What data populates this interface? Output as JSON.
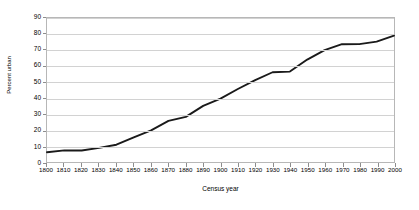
{
  "chart_data": {
    "type": "line",
    "title": "",
    "xlabel": "Census year",
    "ylabel": "Percent urban",
    "xlim": [
      1800,
      2000
    ],
    "ylim": [
      0,
      90
    ],
    "ytick_step": 10,
    "xtick_step": 10,
    "grid": true,
    "grid_axis": "y",
    "legend": false,
    "line_color": "#1a1a1a",
    "grid_color": "#d2d2d2",
    "border_color": "#b7b7b7",
    "yticks": [
      0,
      10,
      20,
      30,
      40,
      50,
      60,
      70,
      80,
      90
    ],
    "categories": [
      1800,
      1810,
      1820,
      1830,
      1840,
      1850,
      1860,
      1870,
      1880,
      1890,
      1900,
      1910,
      1920,
      1930,
      1940,
      1950,
      1960,
      1970,
      1980,
      1990,
      2000
    ],
    "x": [
      1800,
      1810,
      1820,
      1830,
      1840,
      1850,
      1860,
      1870,
      1880,
      1890,
      1900,
      1910,
      1920,
      1930,
      1940,
      1950,
      1960,
      1970,
      1980,
      1990,
      2000
    ],
    "values": [
      6.1,
      7.3,
      7.2,
      8.8,
      10.8,
      15.4,
      19.8,
      25.7,
      28.2,
      35.1,
      39.6,
      45.6,
      51.2,
      56.1,
      56.5,
      64.0,
      69.9,
      73.6,
      73.7,
      75.2,
      79.0
    ],
    "series": [
      {
        "name": "Percent urban",
        "color": "#1a1a1a",
        "values": [
          6.1,
          7.3,
          7.2,
          8.8,
          10.8,
          15.4,
          19.8,
          25.7,
          28.2,
          35.1,
          39.6,
          45.6,
          51.2,
          56.1,
          56.5,
          64.0,
          69.9,
          73.6,
          73.7,
          75.2,
          79.0
        ]
      }
    ]
  }
}
